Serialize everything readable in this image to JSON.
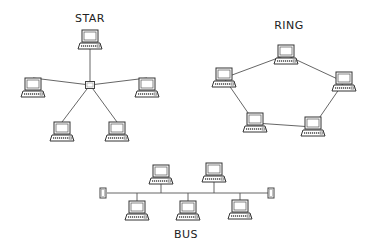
{
  "colors": {
    "stroke": "#3a3a3a",
    "line": "#555555",
    "background": "#ffffff"
  },
  "star": {
    "title": "STAR",
    "title_pos": [
      90,
      12
    ],
    "hub": {
      "x": 90,
      "y": 85,
      "icon": "hub-icon"
    },
    "nodes": [
      {
        "x": 90,
        "y": 40,
        "icon": "computer-icon"
      },
      {
        "x": 33,
        "y": 88,
        "icon": "computer-icon"
      },
      {
        "x": 147,
        "y": 88,
        "icon": "computer-icon"
      },
      {
        "x": 62,
        "y": 132,
        "icon": "computer-icon"
      },
      {
        "x": 117,
        "y": 132,
        "icon": "computer-icon"
      }
    ]
  },
  "ring": {
    "title": "RING",
    "title_pos": [
      289,
      19
    ],
    "nodes": [
      {
        "x": 286,
        "y": 55,
        "icon": "computer-icon"
      },
      {
        "x": 344,
        "y": 82,
        "icon": "computer-icon"
      },
      {
        "x": 313,
        "y": 127,
        "icon": "computer-icon"
      },
      {
        "x": 255,
        "y": 123,
        "icon": "computer-icon"
      },
      {
        "x": 224,
        "y": 78,
        "icon": "computer-icon"
      }
    ]
  },
  "bus": {
    "title": "BUS",
    "title_pos": [
      186,
      228
    ],
    "backbone": {
      "x1": 107,
      "x2": 268,
      "y": 193
    },
    "terminators": [
      {
        "x": 103,
        "y": 193,
        "icon": "terminator-icon"
      },
      {
        "x": 271,
        "y": 193,
        "icon": "terminator-icon"
      }
    ],
    "nodes": [
      {
        "x": 161,
        "y": 175,
        "side": "top",
        "icon": "computer-icon"
      },
      {
        "x": 214,
        "y": 173,
        "side": "top",
        "icon": "computer-icon"
      },
      {
        "x": 137,
        "y": 211,
        "side": "bottom",
        "icon": "computer-icon"
      },
      {
        "x": 188,
        "y": 211,
        "side": "bottom",
        "icon": "computer-icon"
      },
      {
        "x": 240,
        "y": 210,
        "side": "bottom",
        "icon": "computer-icon"
      }
    ]
  }
}
